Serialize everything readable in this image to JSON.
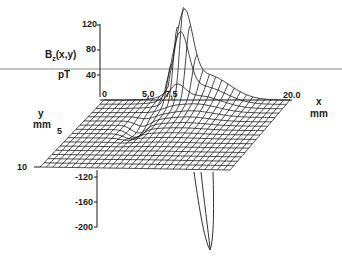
{
  "figure": {
    "z_axis": {
      "label": "B",
      "label_sub": "z",
      "label_args": "(x,y)",
      "unit": "pT",
      "ticks_upper": [
        "120",
        "80",
        "40"
      ],
      "ticks_lower": [
        "-120",
        "-160",
        "-200"
      ]
    },
    "x_axis": {
      "label": "x",
      "unit": "mm",
      "ticks": [
        "0",
        "5.0",
        "7.5",
        "20.0"
      ]
    },
    "y_axis": {
      "label": "y",
      "unit": "mm",
      "ticks": [
        "5",
        "10"
      ]
    },
    "colors": {
      "ink": "#1a1a1a",
      "reference_line": "#8a8a8a",
      "background": "#ffffff"
    }
  },
  "chart_data": {
    "type": "surface",
    "title": "",
    "zlabel": "Bz(x,y) pT",
    "xlabel": "x mm",
    "ylabel": "y mm",
    "x_ticks": [
      0,
      5.0,
      7.5,
      20.0
    ],
    "y_ticks": [
      5,
      10
    ],
    "z_ticks": [
      120,
      80,
      40,
      -120,
      -160,
      -200
    ],
    "zlim": [
      -200,
      130
    ],
    "xlim": [
      0,
      20
    ],
    "ylim": [
      0,
      10
    ],
    "features": [
      {
        "kind": "peak",
        "approx_value_pT": 125,
        "approx_x_mm": 8.5
      },
      {
        "kind": "trough",
        "approx_value_pT": -210,
        "approx_x_mm": 8.5
      },
      {
        "kind": "saddle_dip",
        "approx_x_mm": 6.5,
        "approx_y_mm": 4
      }
    ],
    "grid": "wireframe mesh"
  }
}
